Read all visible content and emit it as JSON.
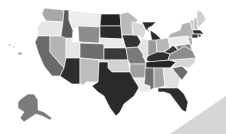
{
  "map": {
    "type": "choropleth",
    "region": "United States",
    "palette": "grayscale",
    "background": "#ffffff",
    "corner_shape_color": "#d6d6d6",
    "states": [
      {
        "id": "WA",
        "shade": "#a8a8a8",
        "points": "44,8 64,10 63,22 46,21 42,14"
      },
      {
        "id": "OR",
        "shade": "#e6e6e6",
        "points": "42,21 63,22 61,36 38,36 37,28"
      },
      {
        "id": "CA",
        "shade": "#6a6a6a",
        "points": "38,36 50,36 50,52 64,68 60,76 52,76 44,66 38,52 35,42"
      },
      {
        "id": "ID",
        "shade": "#5a5a5a",
        "points": "64,10 69,10 69,20 73,30 72,42 60,42 61,36 63,22"
      },
      {
        "id": "NV",
        "shade": "#b4b4b4",
        "points": "50,36 61,36 66,38 66,58 64,68 50,52"
      },
      {
        "id": "MT",
        "shade": "#ececec",
        "points": "69,10 101,14 100,27 78,26 73,30 69,20"
      },
      {
        "id": "WY",
        "shade": "#8c8c8c",
        "points": "78,26 100,27 99,43 79,42"
      },
      {
        "id": "UT",
        "shade": "#e4e4e4",
        "points": "66,38 72,38 72,42 80,42 80,58 66,58"
      },
      {
        "id": "AZ",
        "shade": "#2e2e2e",
        "points": "66,58 80,58 80,84 72,84 60,76 64,68"
      },
      {
        "id": "CO",
        "shade": "#6e6e6e",
        "points": "80,43 104,44 104,60 80,58"
      },
      {
        "id": "NM",
        "shade": "#bdbdbd",
        "points": "80,58 99,60 98,82 86,82 84,85 80,84"
      },
      {
        "id": "ND",
        "shade": "#232323",
        "points": "101,14 120,14 121,26 100,26"
      },
      {
        "id": "SD",
        "shade": "#2b2b2b",
        "points": "100,26 121,26 122,39 100,38"
      },
      {
        "id": "NE",
        "shade": "#e8e8e8",
        "points": "100,38 122,39 126,48 104,48 104,44 99,43"
      },
      {
        "id": "KS",
        "shade": "#3a3a3a",
        "points": "104,48 126,48 128,60 104,60"
      },
      {
        "id": "OK",
        "shade": "#d2d2d2",
        "points": "99,60 128,60 130,72 112,72 108,68 108,62 99,62"
      },
      {
        "id": "TX",
        "shade": "#2a2a2a",
        "points": "108,62 108,68 112,72 130,72 138,74 140,86 134,96 124,104 120,112 116,116 110,108 104,96 98,92 92,86 98,82 99,62"
      },
      {
        "id": "MN",
        "shade": "#bababa",
        "points": "120,14 128,12 138,20 132,26 133,35 122,35 121,26"
      },
      {
        "id": "IA",
        "shade": "#333333",
        "points": "122,35 137,35 141,42 138,47 126,48"
      },
      {
        "id": "MO",
        "shade": "#7a7a7a",
        "points": "126,48 138,47 143,54 146,64 130,64 128,60"
      },
      {
        "id": "AR",
        "shade": "#a0a0a0",
        "points": "130,64 146,64 145,78 133,78 130,72"
      },
      {
        "id": "LA",
        "shade": "#eaeaea",
        "points": "133,78 145,78 144,84 150,86 150,92 140,92 138,86"
      },
      {
        "id": "WI",
        "shade": "#d8d8d8",
        "points": "132,22 142,24 146,30 144,38 137,35 133,35 132,26"
      },
      {
        "id": "MI",
        "shade": "#2a2a2a",
        "points": "142,22 156,22 152,26 148,28 148,32 150,30 156,34 162,40 158,44 152,42 150,30 146,30"
      },
      {
        "id": "IL",
        "shade": "#e2e2e2",
        "points": "141,38 148,40 150,52 148,58 143,58 143,54 138,47 141,42"
      },
      {
        "id": "IN",
        "shade": "#9a9a9a",
        "points": "148,40 156,40 157,52 150,56 148,56"
      },
      {
        "id": "OH",
        "shade": "#b7b7b7",
        "points": "156,40 168,38 170,48 164,52 157,52"
      },
      {
        "id": "KY",
        "shade": "#2f2f2f",
        "points": "146,60 148,56 157,52 164,52 170,54 168,60 150,62"
      },
      {
        "id": "TN",
        "shade": "#262626",
        "points": "146,62 170,60 176,62 170,68 146,68"
      },
      {
        "id": "MS",
        "shade": "#6f6f6f",
        "points": "145,68 154,68 154,88 150,90 150,86 144,84 145,78"
      },
      {
        "id": "AL",
        "shade": "#a4a4a4",
        "points": "154,68 163,68 165,86 158,88 154,88"
      },
      {
        "id": "GA",
        "shade": "#e0e0e0",
        "points": "163,68 172,68 180,78 178,88 166,88 165,86"
      },
      {
        "id": "FL",
        "shade": "#2c2c2c",
        "points": "158,88 178,88 184,94 188,102 186,112 182,110 176,102 170,94 164,92 158,92"
      },
      {
        "id": "SC",
        "shade": "#6c6c6c",
        "points": "172,68 182,66 188,72 182,80 180,78"
      },
      {
        "id": "NC",
        "shade": "#d6d6d6",
        "points": "170,60 196,58 194,64 188,68 182,66 172,68 176,62"
      },
      {
        "id": "VA",
        "shade": "#8e8e8e",
        "points": "170,54 178,50 184,46 192,50 196,58 170,60 168,60"
      },
      {
        "id": "WV",
        "shade": "#3c3c3c",
        "points": "164,52 170,48 172,44 176,48 178,50 170,54"
      },
      {
        "id": "PA",
        "shade": "#ececec",
        "points": "168,38 188,36 190,44 172,46 170,48"
      },
      {
        "id": "MD",
        "shade": "#7e7e7e",
        "points": "176,46 190,44 192,50 184,46 178,50"
      },
      {
        "id": "NJ",
        "shade": "#9e9e9e",
        "points": "188,36 192,38 192,46 190,44"
      },
      {
        "id": "NY",
        "shade": "#b2b2b2",
        "points": "170,34 180,30 182,24 190,22 194,34 192,38 188,36 168,38"
      },
      {
        "id": "VT",
        "shade": "#c8c8c8",
        "points": "190,20 194,20 194,30 192,30"
      },
      {
        "id": "NH",
        "shade": "#bebebe",
        "points": "194,18 197,18 198,30 194,30"
      },
      {
        "id": "ME",
        "shade": "#cfcfcf",
        "points": "197,10 202,12 206,20 200,26 198,28 197,18"
      },
      {
        "id": "MA",
        "shade": "#2a2a2a",
        "points": "192,30 200,30 204,34 194,34"
      },
      {
        "id": "CT",
        "shade": "#3a3a3a",
        "points": "192,34 198,34 198,38 192,38"
      },
      {
        "id": "RI",
        "shade": "#555555",
        "points": "198,34 201,34 201,37 198,37"
      },
      {
        "id": "AK",
        "shade": "#7c7c7c",
        "points": "22,98 28,94 34,94 38,100 38,110 44,112 52,118 50,120 42,116 36,114 30,118 24,122 20,118 24,112 18,108 18,102"
      },
      {
        "id": "HI1",
        "shade": "#c6c6c6",
        "points": "8,44 11,44 11,46 8,46"
      },
      {
        "id": "HI2",
        "shade": "#c6c6c6",
        "points": "13,46 15,46 15,48 13,48"
      },
      {
        "id": "HI3",
        "shade": "#b0b0b0",
        "points": "18,52 22,52 22,55 18,55"
      }
    ]
  }
}
